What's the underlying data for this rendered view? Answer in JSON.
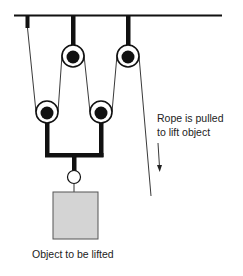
{
  "diagram": {
    "labels": {
      "rope_pulled_line1": "Rope is pulled",
      "rope_pulled_line2": "to lift object",
      "object": "Object to be lifted"
    },
    "colors": {
      "line": "#111111",
      "object_fill": "#d4d4d4",
      "object_stroke": "#555555",
      "background": "#ffffff"
    },
    "components": {
      "ceiling": "ceiling-beam",
      "fixed_pulleys": 2,
      "moving_pulleys": 2,
      "rope_anchor": "left-anchor",
      "load": "box"
    }
  }
}
